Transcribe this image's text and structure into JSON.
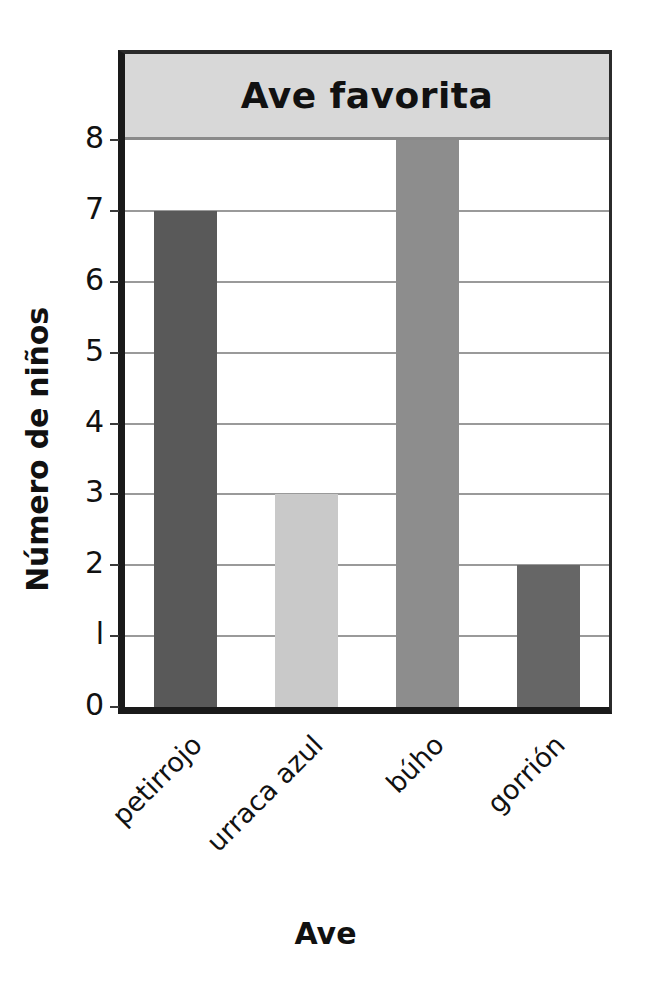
{
  "chart_data": {
    "type": "bar",
    "title": "Ave favorita",
    "xlabel": "Ave",
    "ylabel": "Número de niños",
    "categories": [
      "petirrojo",
      "urraca azul",
      "büho",
      "gorrión"
    ],
    "categories_display": [
      "petirrojo",
      "urraca azul",
      "búho",
      "gorrión"
    ],
    "values": [
      7,
      3,
      8,
      2
    ],
    "ylim": [
      0,
      8
    ],
    "yticks": [
      "0",
      "l",
      "2",
      "3",
      "4",
      "5",
      "6",
      "7",
      "8"
    ],
    "ytick_values": [
      0,
      1,
      2,
      3,
      4,
      5,
      6,
      7,
      8
    ],
    "grid": true,
    "legend": false,
    "bar_colors": [
      "#595959",
      "#c9c9c9",
      "#8d8d8d",
      "#666666"
    ],
    "title_band_color": "#d8d8d8",
    "gridline_color": "#9a9a9a",
    "axis_color": "#1a1a1a",
    "background": "#ffffff"
  }
}
